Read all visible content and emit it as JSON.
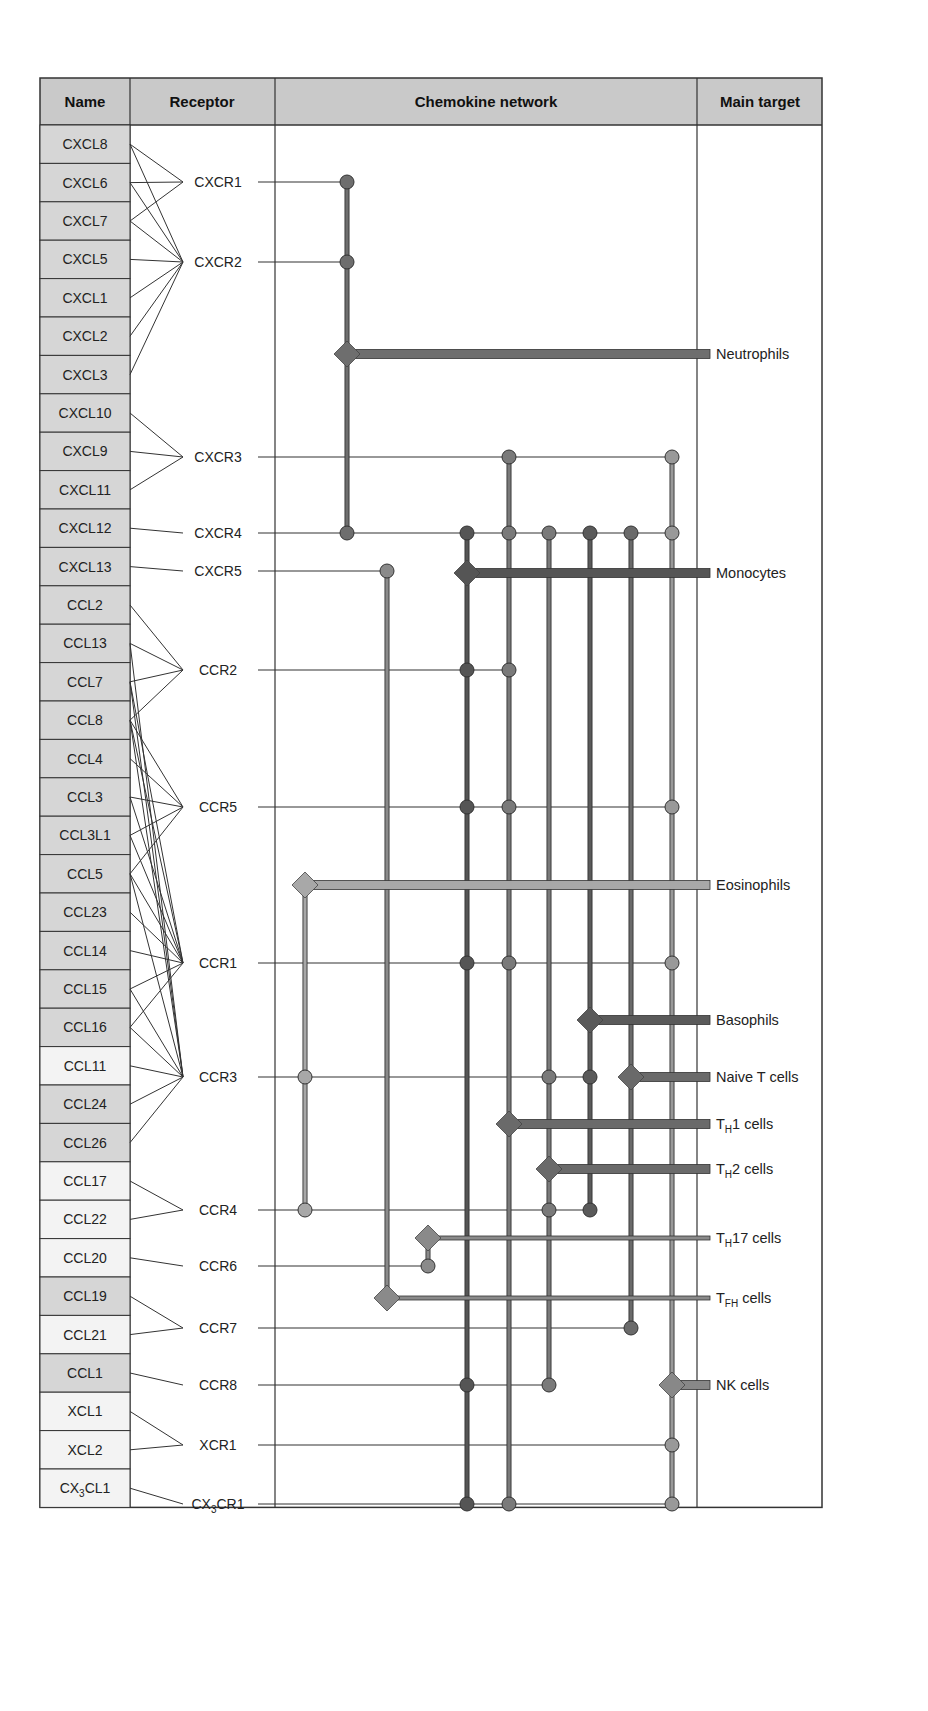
{
  "header": {
    "name": "Name",
    "receptor": "Receptor",
    "network": "Chemokine network",
    "target": "Main target"
  },
  "colors": {
    "header_bg": "#c9c9c9",
    "name_gray": "#d6d6d6",
    "name_light": "#f3f3f3",
    "border": "#333333",
    "thin_line": "#333333",
    "col_dark": "#5a5a5a",
    "col_mid": "#7a7a7a",
    "col_light": "#999999",
    "col_pale": "#a8a8a8"
  },
  "chemokines": [
    {
      "name": "CXCL8",
      "shade": "gray"
    },
    {
      "name": "CXCL6",
      "shade": "gray"
    },
    {
      "name": "CXCL7",
      "shade": "gray"
    },
    {
      "name": "CXCL5",
      "shade": "gray"
    },
    {
      "name": "CXCL1",
      "shade": "gray"
    },
    {
      "name": "CXCL2",
      "shade": "gray"
    },
    {
      "name": "CXCL3",
      "shade": "gray"
    },
    {
      "name": "CXCL10",
      "shade": "gray"
    },
    {
      "name": "CXCL9",
      "shade": "gray"
    },
    {
      "name": "CXCL11",
      "shade": "gray"
    },
    {
      "name": "CXCL12",
      "shade": "gray"
    },
    {
      "name": "CXCL13",
      "shade": "gray"
    },
    {
      "name": "CCL2",
      "shade": "gray"
    },
    {
      "name": "CCL13",
      "shade": "gray"
    },
    {
      "name": "CCL7",
      "shade": "gray"
    },
    {
      "name": "CCL8",
      "shade": "gray"
    },
    {
      "name": "CCL4",
      "shade": "gray"
    },
    {
      "name": "CCL3",
      "shade": "gray"
    },
    {
      "name": "CCL3L1",
      "shade": "gray"
    },
    {
      "name": "CCL5",
      "shade": "gray"
    },
    {
      "name": "CCL23",
      "shade": "gray"
    },
    {
      "name": "CCL14",
      "shade": "gray"
    },
    {
      "name": "CCL15",
      "shade": "gray"
    },
    {
      "name": "CCL16",
      "shade": "gray"
    },
    {
      "name": "CCL11",
      "shade": "light"
    },
    {
      "name": "CCL24",
      "shade": "gray"
    },
    {
      "name": "CCL26",
      "shade": "gray"
    },
    {
      "name": "CCL17",
      "shade": "light"
    },
    {
      "name": "CCL22",
      "shade": "light"
    },
    {
      "name": "CCL20",
      "shade": "light"
    },
    {
      "name": "CCL19",
      "shade": "gray"
    },
    {
      "name": "CCL21",
      "shade": "light"
    },
    {
      "name": "CCL1",
      "shade": "gray"
    },
    {
      "name": "XCL1",
      "shade": "light"
    },
    {
      "name": "XCL2",
      "shade": "light"
    },
    {
      "name": "CX3CL1",
      "display": "CX",
      "sub": "3",
      "rest": "CL1",
      "shade": "light"
    }
  ],
  "receptors": [
    {
      "name": "CXCR1",
      "y": 182,
      "ligands": [
        "CXCL8",
        "CXCL6",
        "CXCL7"
      ]
    },
    {
      "name": "CXCR2",
      "y": 262,
      "ligands": [
        "CXCL8",
        "CXCL6",
        "CXCL7",
        "CXCL5",
        "CXCL1",
        "CXCL2",
        "CXCL3"
      ]
    },
    {
      "name": "CXCR3",
      "y": 457,
      "ligands": [
        "CXCL10",
        "CXCL9",
        "CXCL11"
      ]
    },
    {
      "name": "CXCR4",
      "y": 533,
      "ligands": [
        "CXCL12"
      ]
    },
    {
      "name": "CXCR5",
      "y": 571,
      "ligands": [
        "CXCL13"
      ]
    },
    {
      "name": "CCR2",
      "y": 670,
      "ligands": [
        "CCL2",
        "CCL13",
        "CCL7",
        "CCL8"
      ]
    },
    {
      "name": "CCR5",
      "y": 807,
      "ligands": [
        "CCL8",
        "CCL4",
        "CCL3",
        "CCL3L1",
        "CCL5"
      ]
    },
    {
      "name": "CCR1",
      "y": 963,
      "ligands": [
        "CCL7",
        "CCL8",
        "CCL3",
        "CCL3L1",
        "CCL5",
        "CCL23",
        "CCL14",
        "CCL15",
        "CCL16"
      ]
    },
    {
      "name": "CCR3",
      "y": 1077,
      "ligands": [
        "CCL13",
        "CCL7",
        "CCL8",
        "CCL5",
        "CCL15",
        "CCL16",
        "CCL11",
        "CCL24",
        "CCL26"
      ]
    },
    {
      "name": "CCR4",
      "y": 1210,
      "ligands": [
        "CCL17",
        "CCL22"
      ]
    },
    {
      "name": "CCR6",
      "y": 1266,
      "ligands": [
        "CCL20"
      ]
    },
    {
      "name": "CCR7",
      "y": 1328,
      "ligands": [
        "CCL19",
        "CCL21"
      ]
    },
    {
      "name": "CCR8",
      "y": 1385,
      "ligands": [
        "CCL1"
      ]
    },
    {
      "name": "XCR1",
      "y": 1445,
      "ligands": [
        "XCL1",
        "XCL2"
      ]
    },
    {
      "name": "CX3CR1",
      "display": "CX",
      "sub": "3",
      "rest": "CR1",
      "y": 1504,
      "ligands": [
        "CX3CL1"
      ]
    }
  ],
  "targets": [
    {
      "name": "Neutrophils",
      "label": "Neutrophils",
      "y": 354,
      "diamond_x": 347,
      "color": "#6e6e6e",
      "thick": 9
    },
    {
      "name": "Monocytes",
      "label": "Monocytes",
      "y": 573,
      "diamond_x": 467,
      "color": "#555555",
      "thick": 9
    },
    {
      "name": "Eosinophils",
      "label": "Eosinophils",
      "y": 885,
      "diamond_x": 305,
      "color": "#a8a8a8",
      "thick": 9
    },
    {
      "name": "Basophils",
      "label": "Basophils",
      "y": 1020,
      "diamond_x": 590,
      "color": "#5a5a5a",
      "thick": 9
    },
    {
      "name": "Naive T cells",
      "label": "Naive T cells",
      "y": 1077,
      "diamond_x": 631,
      "color": "#6a6a6a",
      "thick": 9
    },
    {
      "name": "TH1 cells",
      "pre": "T",
      "sub": "H",
      "post": "1 cells",
      "y": 1124,
      "diamond_x": 509,
      "color": "#6a6a6a",
      "thick": 9
    },
    {
      "name": "TH2 cells",
      "pre": "T",
      "sub": "H",
      "post": "2 cells",
      "y": 1169,
      "diamond_x": 549,
      "color": "#6a6a6a",
      "thick": 9
    },
    {
      "name": "TH17 cells",
      "pre": "T",
      "sub": "H",
      "post": "17 cells",
      "y": 1238,
      "diamond_x": 428,
      "color": "#8a8a8a",
      "thick": 4
    },
    {
      "name": "TFH cells",
      "pre": "T",
      "sub": "FH",
      "post": " cells",
      "y": 1298,
      "diamond_x": 387,
      "color": "#8a8a8a",
      "thick": 4
    },
    {
      "name": "NK cells",
      "label": "NK cells",
      "y": 1385,
      "diamond_x": 672,
      "color": "#888888",
      "thick": 9
    }
  ],
  "network_columns": [
    {
      "x": 347,
      "y1": 182,
      "y2": 533,
      "color": "#6e6e6e"
    },
    {
      "x": 305,
      "y1": 885,
      "y2": 1210,
      "color": "#a8a8a8"
    },
    {
      "x": 387,
      "y1": 571,
      "y2": 1298,
      "color": "#8a8a8a"
    },
    {
      "x": 428,
      "y1": 1238,
      "y2": 1266,
      "color": "#8a8a8a"
    },
    {
      "x": 467,
      "y1": 533,
      "y2": 1504,
      "color": "#555555"
    },
    {
      "x": 509,
      "y1": 457,
      "y2": 1504,
      "color": "#7a7a7a"
    },
    {
      "x": 549,
      "y1": 533,
      "y2": 1385,
      "color": "#7a7a7a"
    },
    {
      "x": 590,
      "y1": 533,
      "y2": 1210,
      "color": "#5a5a5a"
    },
    {
      "x": 631,
      "y1": 533,
      "y2": 1328,
      "color": "#6a6a6a"
    },
    {
      "x": 672,
      "y1": 457,
      "y2": 1504,
      "color": "#999999"
    }
  ],
  "network_dots": [
    {
      "receptor": "CXCR1",
      "x": 347
    },
    {
      "receptor": "CXCR2",
      "x": 347
    },
    {
      "receptor": "CXCR3",
      "x": 509
    },
    {
      "receptor": "CXCR3",
      "x": 672
    },
    {
      "receptor": "CXCR4",
      "x": 347
    },
    {
      "receptor": "CXCR4",
      "x": 467
    },
    {
      "receptor": "CXCR4",
      "x": 509
    },
    {
      "receptor": "CXCR4",
      "x": 549
    },
    {
      "receptor": "CXCR4",
      "x": 590
    },
    {
      "receptor": "CXCR4",
      "x": 631
    },
    {
      "receptor": "CXCR4",
      "x": 672
    },
    {
      "receptor": "CXCR5",
      "x": 387
    },
    {
      "receptor": "CCR2",
      "x": 467
    },
    {
      "receptor": "CCR2",
      "x": 509
    },
    {
      "receptor": "CCR5",
      "x": 467
    },
    {
      "receptor": "CCR5",
      "x": 509
    },
    {
      "receptor": "CCR5",
      "x": 672
    },
    {
      "receptor": "CCR1",
      "x": 467
    },
    {
      "receptor": "CCR1",
      "x": 509
    },
    {
      "receptor": "CCR1",
      "x": 672
    },
    {
      "receptor": "CCR3",
      "x": 305
    },
    {
      "receptor": "CCR3",
      "x": 549
    },
    {
      "receptor": "CCR3",
      "x": 590
    },
    {
      "receptor": "CCR4",
      "x": 305
    },
    {
      "receptor": "CCR4",
      "x": 549
    },
    {
      "receptor": "CCR4",
      "x": 590
    },
    {
      "receptor": "CCR6",
      "x": 428
    },
    {
      "receptor": "CCR7",
      "x": 631
    },
    {
      "receptor": "CCR8",
      "x": 467
    },
    {
      "receptor": "CCR8",
      "x": 549
    },
    {
      "receptor": "XCR1",
      "x": 672
    },
    {
      "receptor": "CX3CR1",
      "x": 467
    },
    {
      "receptor": "CX3CR1",
      "x": 509
    },
    {
      "receptor": "CX3CR1",
      "x": 672
    }
  ]
}
